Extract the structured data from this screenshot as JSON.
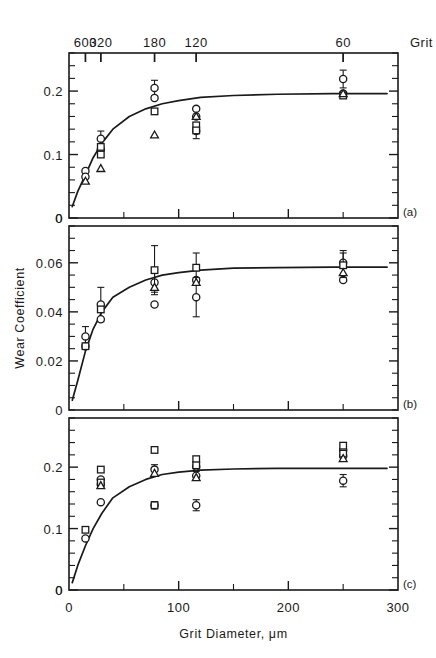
{
  "figure": {
    "panel_labels": [
      "(a)",
      "(b)",
      "(c)"
    ],
    "x_axis_bottom": {
      "title": "Grit Diameter, μm",
      "ticks": [
        0,
        100,
        200,
        300
      ],
      "tick_labels": [
        "0",
        "100",
        "200",
        "300"
      ],
      "minor_ticks": [
        50,
        150,
        250
      ],
      "range": [
        0,
        300
      ]
    },
    "x_axis_top": {
      "title": "Grit",
      "ticks": [
        15,
        29,
        78,
        116,
        250
      ],
      "tick_labels": [
        "600",
        "320",
        "180",
        "120",
        "60"
      ]
    },
    "y_axis_label": "Wear Coefficient"
  },
  "chart_data": [
    {
      "type": "scatter",
      "panel": "(a)",
      "title": "",
      "xlabel": "Grit Diameter, μm",
      "ylabel": "Wear Coefficient",
      "xlim": [
        0,
        300
      ],
      "ylim": [
        0,
        0.26
      ],
      "yticks": [
        0,
        0.1,
        0.2
      ],
      "ytick_labels": [
        "0",
        "0.1",
        "0.2"
      ],
      "y_minor_step": 0.02,
      "grid": false,
      "legend": "none",
      "curve": {
        "name": "fitted curve",
        "x": [
          3,
          8,
          15,
          22,
          30,
          40,
          55,
          70,
          85,
          100,
          120,
          150,
          190,
          240,
          290
        ],
        "y": [
          0.018,
          0.042,
          0.068,
          0.095,
          0.118,
          0.14,
          0.16,
          0.172,
          0.18,
          0.185,
          0.19,
          0.193,
          0.195,
          0.196,
          0.196
        ]
      },
      "series": [
        {
          "name": "circle",
          "marker": "circle",
          "points": [
            {
              "x": 15,
              "y": 0.074,
              "err": 0.0
            },
            {
              "x": 15,
              "y": 0.065,
              "err": 0.0
            },
            {
              "x": 29,
              "y": 0.125,
              "err": 0.012
            },
            {
              "x": 29,
              "y": 0.108,
              "err": 0.0
            },
            {
              "x": 78,
              "y": 0.205,
              "err": 0.012
            },
            {
              "x": 78,
              "y": 0.189,
              "err": 0.0
            },
            {
              "x": 116,
              "y": 0.172,
              "err": 0.0
            },
            {
              "x": 116,
              "y": 0.16,
              "err": 0.0
            },
            {
              "x": 116,
              "y": 0.137,
              "err": 0.012
            },
            {
              "x": 250,
              "y": 0.219,
              "err": 0.014
            },
            {
              "x": 250,
              "y": 0.196,
              "err": 0.0
            }
          ]
        },
        {
          "name": "square",
          "marker": "square",
          "points": [
            {
              "x": 29,
              "y": 0.1,
              "err": 0.0
            },
            {
              "x": 29,
              "y": 0.112,
              "err": 0.0
            },
            {
              "x": 78,
              "y": 0.168,
              "err": 0.0
            },
            {
              "x": 116,
              "y": 0.146,
              "err": 0.0
            },
            {
              "x": 116,
              "y": 0.138,
              "err": 0.0
            },
            {
              "x": 250,
              "y": 0.193,
              "err": 0.0
            }
          ]
        },
        {
          "name": "triangle",
          "marker": "triangle",
          "points": [
            {
              "x": 15,
              "y": 0.058,
              "err": 0.0
            },
            {
              "x": 29,
              "y": 0.078,
              "err": 0.0
            },
            {
              "x": 78,
              "y": 0.131,
              "err": 0.0
            },
            {
              "x": 116,
              "y": 0.16,
              "err": 0.0
            },
            {
              "x": 250,
              "y": 0.196,
              "err": 0.0
            }
          ]
        }
      ]
    },
    {
      "type": "scatter",
      "panel": "(b)",
      "title": "",
      "xlabel": "Grit Diameter, μm",
      "ylabel": "Wear Coefficient",
      "xlim": [
        0,
        300
      ],
      "ylim": [
        0,
        0.075
      ],
      "yticks": [
        0.02,
        0.04,
        0.06
      ],
      "ytick_labels": [
        "0.02",
        "0.04",
        "0.06"
      ],
      "y_minor_step": 0.005,
      "grid": false,
      "legend": "none",
      "curve": {
        "name": "fitted curve",
        "x": [
          3,
          8,
          15,
          22,
          30,
          40,
          55,
          70,
          85,
          100,
          120,
          150,
          190,
          240,
          290
        ],
        "y": [
          0.004,
          0.012,
          0.024,
          0.033,
          0.04,
          0.046,
          0.05,
          0.053,
          0.055,
          0.056,
          0.057,
          0.0578,
          0.058,
          0.0582,
          0.0582
        ]
      },
      "series": [
        {
          "name": "circle",
          "marker": "circle",
          "points": [
            {
              "x": 15,
              "y": 0.03,
              "err": 0.004
            },
            {
              "x": 15,
              "y": 0.026,
              "err": 0.0
            },
            {
              "x": 29,
              "y": 0.043,
              "err": 0.007
            },
            {
              "x": 29,
              "y": 0.037,
              "err": 0.0
            },
            {
              "x": 78,
              "y": 0.052,
              "err": 0.004
            },
            {
              "x": 78,
              "y": 0.043,
              "err": 0.0
            },
            {
              "x": 116,
              "y": 0.053,
              "err": 0.0
            },
            {
              "x": 116,
              "y": 0.046,
              "err": 0.008
            },
            {
              "x": 250,
              "y": 0.06,
              "err": 0.005
            },
            {
              "x": 250,
              "y": 0.053,
              "err": 0.0
            }
          ]
        },
        {
          "name": "square",
          "marker": "square",
          "points": [
            {
              "x": 15,
              "y": 0.026,
              "err": 0.0
            },
            {
              "x": 29,
              "y": 0.041,
              "err": 0.0
            },
            {
              "x": 78,
              "y": 0.057,
              "err": 0.01
            },
            {
              "x": 116,
              "y": 0.058,
              "err": 0.006
            },
            {
              "x": 250,
              "y": 0.059,
              "err": 0.005
            }
          ]
        },
        {
          "name": "triangle",
          "marker": "triangle",
          "points": [
            {
              "x": 78,
              "y": 0.05,
              "err": 0.0
            },
            {
              "x": 116,
              "y": 0.052,
              "err": 0.0
            },
            {
              "x": 250,
              "y": 0.056,
              "err": 0.0
            }
          ]
        }
      ]
    },
    {
      "type": "scatter",
      "panel": "(c)",
      "title": "",
      "xlabel": "Grit Diameter, μm",
      "ylabel": "Wear Coefficient",
      "xlim": [
        0,
        300
      ],
      "ylim": [
        0,
        0.28
      ],
      "yticks": [
        0,
        0.1,
        0.2
      ],
      "ytick_labels": [
        "0",
        "0.1",
        "0.2"
      ],
      "y_minor_step": 0.02,
      "grid": false,
      "legend": "none",
      "curve": {
        "name": "fitted curve",
        "x": [
          3,
          8,
          15,
          22,
          30,
          40,
          55,
          70,
          85,
          100,
          120,
          150,
          190,
          240,
          290
        ],
        "y": [
          0.012,
          0.04,
          0.072,
          0.1,
          0.125,
          0.15,
          0.168,
          0.18,
          0.188,
          0.192,
          0.195,
          0.197,
          0.198,
          0.198,
          0.198
        ]
      },
      "series": [
        {
          "name": "circle",
          "marker": "circle",
          "points": [
            {
              "x": 15,
              "y": 0.084,
              "err": 0.0
            },
            {
              "x": 29,
              "y": 0.18,
              "err": 0.0
            },
            {
              "x": 29,
              "y": 0.172,
              "err": 0.0
            },
            {
              "x": 29,
              "y": 0.143,
              "err": 0.0
            },
            {
              "x": 78,
              "y": 0.196,
              "err": 0.008
            },
            {
              "x": 78,
              "y": 0.138,
              "err": 0.006
            },
            {
              "x": 116,
              "y": 0.201,
              "err": 0.008
            },
            {
              "x": 116,
              "y": 0.186,
              "err": 0.0
            },
            {
              "x": 116,
              "y": 0.138,
              "err": 0.009
            },
            {
              "x": 250,
              "y": 0.228,
              "err": 0.0
            },
            {
              "x": 250,
              "y": 0.218,
              "err": 0.0
            },
            {
              "x": 250,
              "y": 0.178,
              "err": 0.01
            }
          ]
        },
        {
          "name": "square",
          "marker": "square",
          "points": [
            {
              "x": 15,
              "y": 0.098,
              "err": 0.0
            },
            {
              "x": 29,
              "y": 0.196,
              "err": 0.0
            },
            {
              "x": 29,
              "y": 0.175,
              "err": 0.0
            },
            {
              "x": 78,
              "y": 0.228,
              "err": 0.0
            },
            {
              "x": 78,
              "y": 0.138,
              "err": 0.0
            },
            {
              "x": 116,
              "y": 0.213,
              "err": 0.0
            },
            {
              "x": 116,
              "y": 0.203,
              "err": 0.0
            },
            {
              "x": 250,
              "y": 0.235,
              "err": 0.0
            },
            {
              "x": 250,
              "y": 0.222,
              "err": 0.0
            }
          ]
        },
        {
          "name": "triangle",
          "marker": "triangle",
          "points": [
            {
              "x": 29,
              "y": 0.17,
              "err": 0.0
            },
            {
              "x": 78,
              "y": 0.19,
              "err": 0.0
            },
            {
              "x": 116,
              "y": 0.183,
              "err": 0.0
            },
            {
              "x": 250,
              "y": 0.214,
              "err": 0.0
            }
          ]
        }
      ]
    }
  ]
}
